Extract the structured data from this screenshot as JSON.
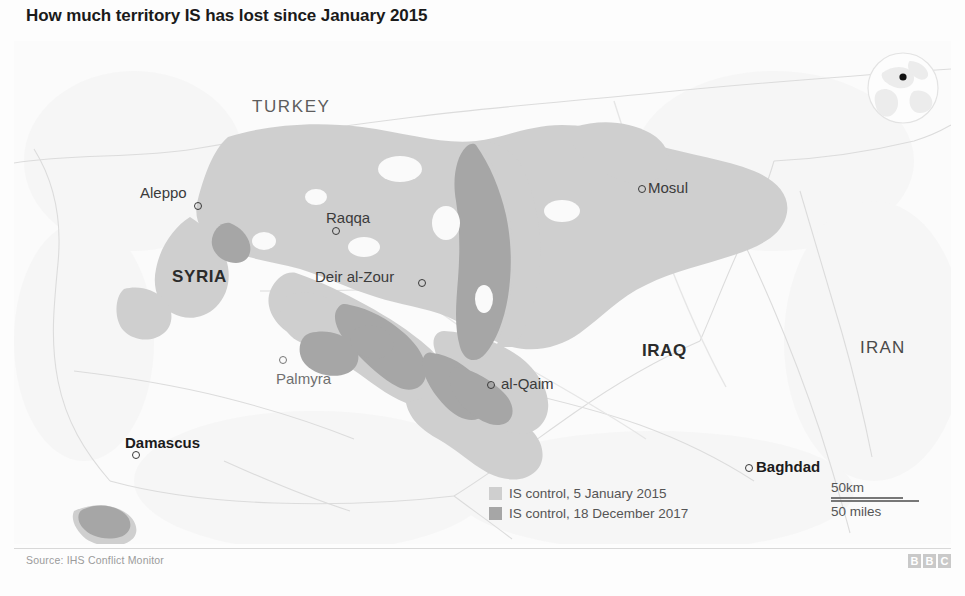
{
  "title": "How much territory IS has lost since January 2015",
  "source": "Source: IHS Conflict Monitor",
  "brand": {
    "letters": [
      "B",
      "B",
      "C"
    ]
  },
  "colors": {
    "control_2015": "#cfcfcf",
    "control_2017": "#a9a9a9",
    "land": "#fbfbfb",
    "border_line": "#e2e2e2",
    "label_dark": "#1c1c1c",
    "label_grey": "#5d5d5d"
  },
  "legend": {
    "items": [
      {
        "label": "IS control, 5 January 2015",
        "swatch": "#cfcfcf",
        "icon": "legend-swatch-2015"
      },
      {
        "label": "IS control, 18 December 2017",
        "swatch": "#a9a9a9",
        "icon": "legend-swatch-2017"
      }
    ]
  },
  "scale": {
    "km_label": "50km",
    "miles_label": "50 miles"
  },
  "locator": {
    "icon": "globe-locator-icon"
  },
  "map": {
    "countries": [
      {
        "name": "TURKEY",
        "bold": false,
        "x": 238,
        "y": 56
      },
      {
        "name": "SYRIA",
        "bold": true,
        "x": 158,
        "y": 226
      },
      {
        "name": "IRAQ",
        "bold": true,
        "x": 628,
        "y": 300
      },
      {
        "name": "IRAN",
        "bold": true,
        "x": 846,
        "y": 297
      },
      {
        "name": "JORDAN",
        "bold": false,
        "x": 205,
        "y": 505
      }
    ],
    "cities": [
      {
        "name": "Aleppo",
        "bold": false,
        "faint": false,
        "label_x": 126,
        "label_y": 143,
        "dot_x": 180,
        "dot_y": 161
      },
      {
        "name": "Raqqa",
        "bold": false,
        "faint": false,
        "label_x": 312,
        "label_y": 168,
        "dot_x": 318,
        "dot_y": 186
      },
      {
        "name": "Mosul",
        "bold": false,
        "faint": false,
        "label_x": 634,
        "label_y": 138,
        "dot_x": 624,
        "dot_y": 144
      },
      {
        "name": "Deir al-Zour",
        "bold": false,
        "faint": false,
        "label_x": 301,
        "label_y": 227,
        "dot_x": 404,
        "dot_y": 238
      },
      {
        "name": "Palmyra",
        "bold": false,
        "faint": true,
        "label_x": 262,
        "label_y": 329,
        "dot_x": 265,
        "dot_y": 315
      },
      {
        "name": "al-Qaim",
        "bold": false,
        "faint": false,
        "label_x": 487,
        "label_y": 334,
        "dot_x": 473,
        "dot_y": 340
      },
      {
        "name": "Damascus",
        "bold": true,
        "faint": false,
        "label_x": 111,
        "label_y": 393,
        "dot_x": 118,
        "dot_y": 410
      },
      {
        "name": "Baghdad",
        "bold": true,
        "faint": false,
        "label_x": 742,
        "label_y": 417,
        "dot_x": 731,
        "dot_y": 423
      }
    ]
  }
}
